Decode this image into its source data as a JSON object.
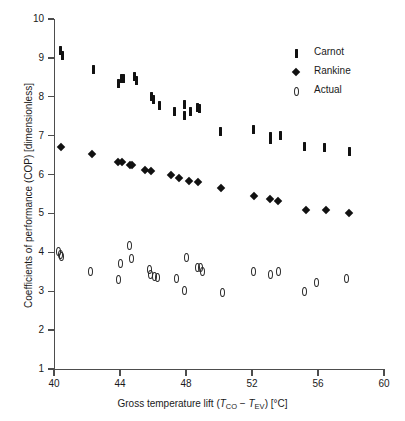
{
  "chart_data": {
    "type": "scatter",
    "title": "",
    "xlabel": "Gross temperature lift (T_CO - T_EV) [°C]",
    "ylabel": "Coefficients of performance (COP) [dimensionless]",
    "xlim": [
      40,
      60
    ],
    "ylim": [
      1,
      10
    ],
    "xticks": [
      40,
      44,
      48,
      52,
      56,
      60
    ],
    "yticks": [
      1,
      2,
      3,
      4,
      5,
      6,
      7,
      8,
      9,
      10
    ],
    "xtick_labels": [
      "40",
      "44",
      "48",
      "52",
      "56",
      "60"
    ],
    "ytick_labels": [
      "1",
      "2",
      "3",
      "4",
      "5",
      "6",
      "7",
      "8",
      "9",
      "10"
    ],
    "grid": false,
    "legend_position": "top-right",
    "series": [
      {
        "name": "Carnot",
        "marker": "vertical-bar",
        "color": "#111111",
        "points": [
          [
            40.4,
            9.18
          ],
          [
            40.5,
            9.05
          ],
          [
            42.4,
            8.7
          ],
          [
            43.9,
            8.35
          ],
          [
            44.1,
            8.48
          ],
          [
            44.2,
            8.48
          ],
          [
            44.9,
            8.52
          ],
          [
            45.0,
            8.42
          ],
          [
            45.9,
            8.0
          ],
          [
            46.0,
            7.92
          ],
          [
            46.4,
            7.78
          ],
          [
            47.3,
            7.62
          ],
          [
            47.9,
            7.8
          ],
          [
            47.9,
            7.52
          ],
          [
            48.3,
            7.62
          ],
          [
            48.7,
            7.72
          ],
          [
            48.8,
            7.7
          ],
          [
            50.1,
            7.12
          ],
          [
            52.1,
            7.15
          ],
          [
            53.1,
            6.98
          ],
          [
            53.1,
            6.9
          ],
          [
            53.7,
            7.0
          ],
          [
            55.2,
            6.72
          ],
          [
            56.4,
            6.7
          ],
          [
            57.9,
            6.6
          ]
        ]
      },
      {
        "name": "Rankine",
        "marker": "diamond",
        "color": "#111111",
        "points": [
          [
            40.4,
            6.7
          ],
          [
            42.3,
            6.52
          ],
          [
            43.9,
            6.32
          ],
          [
            44.1,
            6.32
          ],
          [
            44.6,
            6.24
          ],
          [
            44.7,
            6.24
          ],
          [
            45.5,
            6.12
          ],
          [
            45.9,
            6.08
          ],
          [
            47.1,
            5.98
          ],
          [
            47.6,
            5.92
          ],
          [
            48.2,
            5.84
          ],
          [
            48.7,
            5.8
          ],
          [
            50.1,
            5.66
          ],
          [
            52.1,
            5.44
          ],
          [
            53.1,
            5.36
          ],
          [
            53.6,
            5.32
          ],
          [
            55.3,
            5.08
          ],
          [
            56.5,
            5.08
          ],
          [
            57.9,
            5.02
          ]
        ]
      },
      {
        "name": "Actual",
        "marker": "open-ellipse",
        "color": "#2b2b2b",
        "points": [
          [
            40.3,
            4.02
          ],
          [
            40.4,
            3.95
          ],
          [
            40.45,
            3.9
          ],
          [
            42.2,
            3.52
          ],
          [
            43.9,
            3.3
          ],
          [
            44.0,
            3.72
          ],
          [
            44.6,
            4.18
          ],
          [
            44.7,
            3.85
          ],
          [
            45.8,
            3.55
          ],
          [
            45.85,
            3.42
          ],
          [
            46.1,
            3.38
          ],
          [
            46.3,
            3.36
          ],
          [
            47.4,
            3.34
          ],
          [
            47.9,
            3.02
          ],
          [
            48.0,
            3.86
          ],
          [
            48.7,
            3.62
          ],
          [
            48.9,
            3.6
          ],
          [
            49.0,
            3.52
          ],
          [
            50.2,
            2.98
          ],
          [
            52.1,
            3.5
          ],
          [
            53.1,
            3.44
          ],
          [
            53.6,
            3.5
          ],
          [
            55.2,
            3.0
          ],
          [
            55.9,
            3.22
          ],
          [
            57.7,
            3.32
          ]
        ]
      }
    ]
  },
  "axes": {
    "x_title_parts": {
      "prefix": "Gross temperature lift (",
      "t1": "T",
      "t1_sub": "CO",
      "minus": " − ",
      "t2": "T",
      "t2_sub": "EV",
      "suffix": ") [°C]"
    },
    "y_title": "Coefficients of performance (COP) [dimensionless]"
  },
  "legend": {
    "items": [
      {
        "label": "Carnot",
        "marker": "vertical-bar-icon"
      },
      {
        "label": "Rankine",
        "marker": "diamond-icon"
      },
      {
        "label": "Actual",
        "marker": "open-ellipse-icon"
      }
    ]
  }
}
